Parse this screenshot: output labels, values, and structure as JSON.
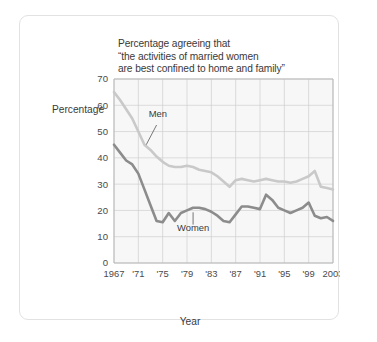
{
  "chart_data": {
    "type": "line",
    "title": "Percentage agreeing that\n“the activities of married women\nare best confined to home and family”",
    "xlabel": "Year",
    "ylabel": "Percentage",
    "ylim": [
      0,
      70
    ],
    "ytick_step": 10,
    "yticks": [
      "0",
      "10",
      "20",
      "30",
      "40",
      "50",
      "60",
      "70"
    ],
    "xlim": [
      1967,
      2003
    ],
    "xticks": [
      1967,
      1971,
      1975,
      1979,
      1983,
      1987,
      1991,
      1995,
      1999,
      2003
    ],
    "xtick_labels": [
      "1967",
      "'71",
      "'75",
      "'79",
      "'83",
      "'87",
      "'91",
      "'95",
      "'99",
      "2003"
    ],
    "grid": true,
    "legend": "inline annotations",
    "annotations": [
      {
        "text": "Men",
        "series": "Men"
      },
      {
        "text": "Women",
        "series": "Women"
      }
    ],
    "x": [
      1967,
      1968,
      1969,
      1970,
      1971,
      1972,
      1973,
      1974,
      1975,
      1976,
      1977,
      1978,
      1979,
      1980,
      1981,
      1982,
      1983,
      1984,
      1985,
      1986,
      1987,
      1988,
      1989,
      1990,
      1991,
      1992,
      1993,
      1994,
      1995,
      1996,
      1997,
      1998,
      1999,
      2000,
      2001,
      2002,
      2003
    ],
    "series": [
      {
        "name": "Men",
        "color": "#c9c9c9",
        "values": [
          65,
          62,
          58.5,
          55,
          50,
          45,
          43,
          40.5,
          38.5,
          37,
          36.5,
          36.5,
          37,
          36.5,
          35.5,
          35,
          34.5,
          33,
          31,
          29,
          31.5,
          32,
          31.5,
          31,
          31.5,
          32,
          31.5,
          31,
          31,
          30.5,
          31,
          32,
          33,
          35,
          29,
          28.5,
          28
        ]
      },
      {
        "name": "Women",
        "color": "#8c8c8c",
        "values": [
          45,
          42,
          39,
          37.5,
          34,
          28,
          22,
          16,
          15.5,
          19,
          16,
          19,
          20,
          21,
          21,
          20.5,
          19.5,
          18,
          16,
          15.5,
          18.5,
          21.5,
          21.5,
          21,
          20.5,
          26,
          24,
          21,
          20,
          19,
          20,
          21,
          23,
          18,
          17,
          17.5,
          16
        ]
      }
    ]
  }
}
